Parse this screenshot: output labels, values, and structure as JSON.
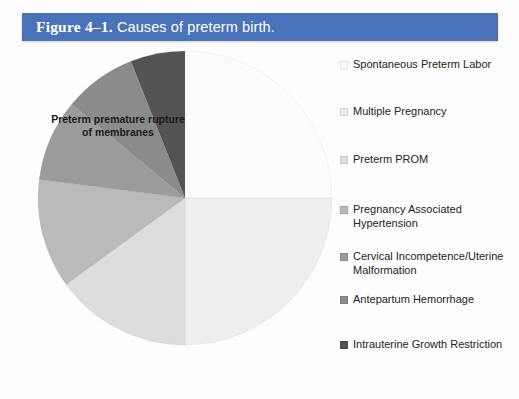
{
  "figure": {
    "title_label": "Figure 4–1.",
    "title_rest": " Causes of preterm birth."
  },
  "annotation": {
    "text": "Preterm premature rupture of membranes"
  },
  "chart_data": {
    "type": "pie",
    "title": "Figure 4–1. Causes of preterm birth.",
    "xlabel": "",
    "ylabel": "",
    "legend_position": "right",
    "grid": false,
    "start_angle_deg": 0,
    "direction": "clockwise",
    "categories": [
      "Spontaneous Preterm Labor",
      "Multiple Pregnancy",
      "Preterm PROM",
      "Pregnancy Associated Hypertension",
      "Cervical Incompetence/Uterine Malformation",
      "Antepartum Hemorrhage",
      "Intrauterine Growth Restriction"
    ],
    "values": [
      25,
      25,
      15,
      12,
      9,
      8,
      6
    ],
    "colors": [
      "#fafbfa",
      "#edefef",
      "#dcdedd",
      "#b9bbbb",
      "#9a9c9c",
      "#8a8c8c",
      "#525454"
    ]
  },
  "legend": {
    "items": [
      {
        "label": "Spontaneous Preterm Labor",
        "color": "#fafbfa"
      },
      {
        "label": "Multiple Pregnancy",
        "color": "#edefef"
      },
      {
        "label": "Preterm PROM",
        "color": "#dcdedd"
      },
      {
        "label": "Pregnancy Associated Hypertension",
        "color": "#b9bbbb"
      },
      {
        "label": "Cervical Incompetence/Uterine Malformation",
        "color": "#9a9c9c"
      },
      {
        "label": "Antepartum Hemorrhage",
        "color": "#8a8c8c"
      },
      {
        "label": "Intrauterine Growth Restriction",
        "color": "#525454"
      }
    ]
  },
  "theme": {
    "banner_color": "#4a72b8",
    "banner_text_color": "#ffffff",
    "page_background": "#fdfdfd"
  }
}
